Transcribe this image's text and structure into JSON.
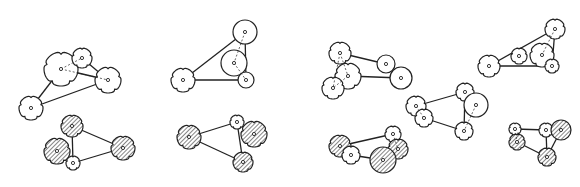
{
  "diagram": {
    "colors": {
      "stroke": "#222222",
      "hatch": "#444444",
      "background": "#ffffff"
    },
    "groups": [
      {
        "id": "g1",
        "nodes": [
          {
            "x": 61,
            "y": 69,
            "r": 17,
            "shape": "flower",
            "fill": "none"
          },
          {
            "x": 82,
            "y": 58,
            "r": 10,
            "shape": "flower",
            "fill": "none"
          },
          {
            "x": 108,
            "y": 80,
            "r": 13,
            "shape": "flower",
            "fill": "none"
          },
          {
            "x": 31,
            "y": 108,
            "r": 12,
            "shape": "flower",
            "fill": "none"
          }
        ],
        "edges": [
          [
            0,
            2
          ],
          [
            1,
            2
          ],
          [
            3,
            0
          ],
          [
            3,
            2
          ]
        ],
        "dashed": [
          [
            0,
            1
          ],
          [
            0,
            2
          ]
        ]
      },
      {
        "id": "g2",
        "nodes": [
          {
            "x": 245,
            "y": 32,
            "r": 12,
            "shape": "circle",
            "fill": "none"
          },
          {
            "x": 234,
            "y": 63,
            "r": 13,
            "shape": "circle",
            "fill": "none"
          },
          {
            "x": 246,
            "y": 80,
            "r": 8,
            "shape": "circle",
            "fill": "none"
          },
          {
            "x": 183,
            "y": 80,
            "r": 12,
            "shape": "flower",
            "fill": "none"
          }
        ],
        "edges": [
          [
            3,
            0
          ],
          [
            3,
            2
          ],
          [
            0,
            2
          ]
        ],
        "dashed": [
          [
            0,
            1
          ],
          [
            1,
            2
          ]
        ]
      },
      {
        "id": "g3",
        "nodes": [
          {
            "x": 72,
            "y": 126,
            "r": 11,
            "shape": "flower",
            "fill": "hatch"
          },
          {
            "x": 57,
            "y": 151,
            "r": 13,
            "shape": "flower",
            "fill": "hatch"
          },
          {
            "x": 73,
            "y": 163,
            "r": 7,
            "shape": "flower",
            "fill": "none"
          },
          {
            "x": 123,
            "y": 148,
            "r": 12,
            "shape": "flower",
            "fill": "hatch"
          }
        ],
        "edges": [
          [
            0,
            3
          ],
          [
            2,
            3
          ],
          [
            0,
            2
          ]
        ],
        "dashed": []
      },
      {
        "id": "g4",
        "nodes": [
          {
            "x": 189,
            "y": 137,
            "r": 12,
            "shape": "flower",
            "fill": "hatch"
          },
          {
            "x": 237,
            "y": 122,
            "r": 7,
            "shape": "flower",
            "fill": "none"
          },
          {
            "x": 254,
            "y": 134,
            "r": 13,
            "shape": "flower",
            "fill": "hatch"
          },
          {
            "x": 243,
            "y": 162,
            "r": 10,
            "shape": "flower",
            "fill": "hatch"
          }
        ],
        "edges": [
          [
            0,
            1
          ],
          [
            0,
            3
          ],
          [
            1,
            3
          ]
        ],
        "dashed": []
      },
      {
        "id": "g5",
        "nodes": [
          {
            "x": 340,
            "y": 53,
            "r": 11,
            "shape": "flower",
            "fill": "none"
          },
          {
            "x": 348,
            "y": 76,
            "r": 13,
            "shape": "flower",
            "fill": "none"
          },
          {
            "x": 333,
            "y": 88,
            "r": 11,
            "shape": "flower",
            "fill": "none"
          },
          {
            "x": 386,
            "y": 64,
            "r": 9,
            "shape": "circle",
            "fill": "none"
          },
          {
            "x": 401,
            "y": 78,
            "r": 11,
            "shape": "circle",
            "fill": "none"
          }
        ],
        "edges": [
          [
            0,
            3
          ],
          [
            1,
            4
          ]
        ],
        "dashed": [
          [
            0,
            1
          ],
          [
            1,
            2
          ],
          [
            0,
            2
          ]
        ]
      },
      {
        "id": "g6",
        "nodes": [
          {
            "x": 555,
            "y": 29,
            "r": 10,
            "shape": "flower",
            "fill": "none"
          },
          {
            "x": 542,
            "y": 55,
            "r": 12,
            "shape": "flower",
            "fill": "none"
          },
          {
            "x": 519,
            "y": 56,
            "r": 8,
            "shape": "flower",
            "fill": "none"
          },
          {
            "x": 552,
            "y": 66,
            "r": 7,
            "shape": "flower",
            "fill": "none"
          },
          {
            "x": 489,
            "y": 66,
            "r": 11,
            "shape": "flower",
            "fill": "none"
          }
        ],
        "edges": [
          [
            4,
            0
          ],
          [
            4,
            3
          ],
          [
            0,
            3
          ]
        ],
        "dashed": [
          [
            0,
            1
          ]
        ]
      },
      {
        "id": "g7",
        "nodes": [
          {
            "x": 416,
            "y": 106,
            "r": 10,
            "shape": "flower",
            "fill": "none"
          },
          {
            "x": 424,
            "y": 118,
            "r": 9,
            "shape": "flower",
            "fill": "none"
          },
          {
            "x": 465,
            "y": 92,
            "r": 9,
            "shape": "flower",
            "fill": "none"
          },
          {
            "x": 476,
            "y": 105,
            "r": 12,
            "shape": "circle",
            "fill": "none"
          },
          {
            "x": 464,
            "y": 131,
            "r": 9,
            "shape": "flower",
            "fill": "none"
          }
        ],
        "edges": [
          [
            0,
            2
          ],
          [
            1,
            4
          ],
          [
            2,
            4
          ]
        ],
        "dashed": [
          [
            0,
            1
          ],
          [
            3,
            4
          ]
        ]
      },
      {
        "id": "g8a",
        "nodes": [
          {
            "x": 340,
            "y": 146,
            "r": 11,
            "shape": "flower",
            "fill": "hatch"
          },
          {
            "x": 351,
            "y": 155,
            "r": 9,
            "shape": "flower",
            "fill": "none"
          },
          {
            "x": 393,
            "y": 134,
            "r": 8,
            "shape": "flower",
            "fill": "none"
          },
          {
            "x": 398,
            "y": 149,
            "r": 10,
            "shape": "flower",
            "fill": "hatch"
          },
          {
            "x": 383,
            "y": 160,
            "r": 13,
            "shape": "circle",
            "fill": "hatch"
          }
        ],
        "edges": [
          [
            0,
            2
          ],
          [
            1,
            4
          ]
        ],
        "dashed": [
          [
            2,
            3
          ]
        ]
      },
      {
        "id": "g8b",
        "nodes": [
          {
            "x": 515,
            "y": 129,
            "r": 6,
            "shape": "flower",
            "fill": "none"
          },
          {
            "x": 517,
            "y": 142,
            "r": 8,
            "shape": "flower",
            "fill": "hatch"
          },
          {
            "x": 546,
            "y": 130,
            "r": 7,
            "shape": "flower",
            "fill": "none"
          },
          {
            "x": 561,
            "y": 130,
            "r": 10,
            "shape": "circle",
            "fill": "hatch"
          },
          {
            "x": 547,
            "y": 157,
            "r": 9,
            "shape": "flower",
            "fill": "hatch"
          }
        ],
        "edges": [
          [
            0,
            2
          ],
          [
            1,
            4
          ],
          [
            2,
            4
          ],
          [
            3,
            4
          ]
        ],
        "dashed": [
          [
            0,
            1
          ]
        ]
      }
    ]
  }
}
